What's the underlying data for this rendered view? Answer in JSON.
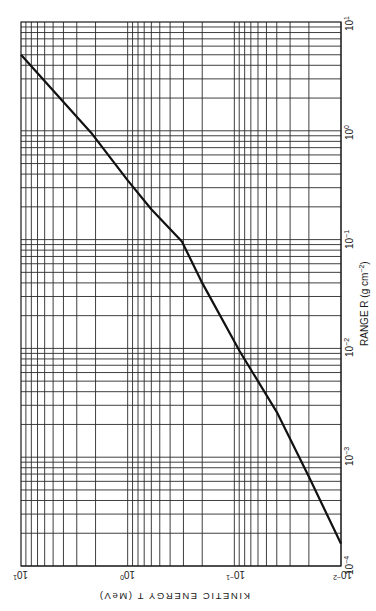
{
  "chart_data": {
    "type": "line",
    "title": "",
    "orientation": "rotated 90 degrees (range axis vertical on right, energy axis horizontal at bottom, text upside-down)",
    "xlabel": "RANGE R (g cm⁻²)",
    "ylabel": "KINETIC ENERGY T (MeV)",
    "xscale": "log",
    "yscale": "log",
    "xlim": [
      0.0001,
      10
    ],
    "ylim": [
      0.01,
      10
    ],
    "x_ticks": [
      "10⁻⁴",
      "10⁻³",
      "10⁻²",
      "10⁻¹",
      "10⁰",
      "10¹"
    ],
    "y_ticks": [
      "10⁻²",
      "10⁻¹",
      "10⁰",
      "10¹"
    ],
    "grid": true,
    "grid_type": "log-log with minor lines 2-9 per decade",
    "legend": null,
    "series": [
      {
        "name": "T vs R",
        "points": [
          {
            "R": 0.00016,
            "T": 0.01
          },
          {
            "R": 0.00066,
            "T": 0.02
          },
          {
            "R": 0.0026,
            "T": 0.04
          },
          {
            "R": 0.0094,
            "T": 0.089
          },
          {
            "R": 0.04,
            "T": 0.2
          },
          {
            "R": 0.096,
            "T": 0.31
          },
          {
            "R": 0.19,
            "T": 0.6
          },
          {
            "R": 0.35,
            "T": 1.0
          },
          {
            "R": 0.96,
            "T": 2.2
          },
          {
            "R": 5.0,
            "T": 10.0
          }
        ]
      }
    ]
  },
  "labels": {
    "range_axis_title": "RANGE R (g cm",
    "range_axis_title_exp": "−2",
    "range_axis_title_end": ")",
    "energy_axis_title": "KINETIC ENERGY T (MeV)",
    "range_ticks": [
      {
        "base": "10",
        "exp": "1"
      },
      {
        "base": "10",
        "exp": "0"
      },
      {
        "base": "10",
        "exp": "−1"
      },
      {
        "base": "10",
        "exp": "−2"
      },
      {
        "base": "10",
        "exp": "−3"
      },
      {
        "base": "10",
        "exp": "−4"
      }
    ],
    "energy_ticks": [
      {
        "base": "10",
        "exp": "1"
      },
      {
        "base": "10",
        "exp": "0"
      },
      {
        "base": "10",
        "exp": "−1"
      },
      {
        "base": "10",
        "exp": "−2"
      }
    ]
  },
  "layout": {
    "plot_left": 21,
    "plot_right": 341,
    "plot_top": 22,
    "plot_bottom": 566,
    "line_color": "#1a1a1a",
    "grid_color": "#2a2a2a"
  }
}
